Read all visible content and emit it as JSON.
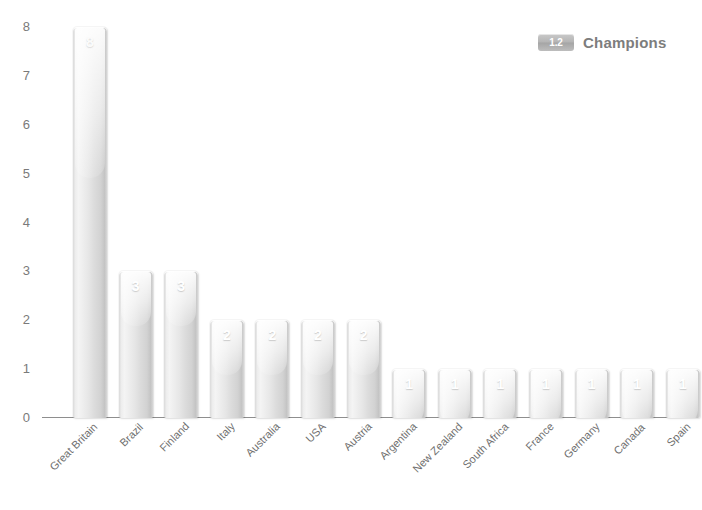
{
  "legend": {
    "swatch_text": "1.2",
    "label": "Champions",
    "swatch_color": "#b4b4b4",
    "label_color": "#7d7d7d"
  },
  "axis": {
    "y_ticks": [
      "0",
      "1",
      "2",
      "3",
      "4",
      "5",
      "6",
      "7",
      "8"
    ],
    "tick_color": "#7a7a7a",
    "baseline_color": "#8e8e8e"
  },
  "chart_data": {
    "type": "bar",
    "title": "Champions",
    "xlabel": "",
    "ylabel": "",
    "ylim": [
      0,
      8
    ],
    "yticks": [
      0,
      1,
      2,
      3,
      4,
      5,
      6,
      7,
      8
    ],
    "grid": false,
    "legend_position": "top-right",
    "orientation": "vertical",
    "bar_color": "#dcdcdc",
    "value_label_color": "#ffffff",
    "categories": [
      "Great Britain",
      "Brazil",
      "Finland",
      "Italy",
      "Australia",
      "USA",
      "Austria",
      "Argentina",
      "New Zealand",
      "South Africa",
      "France",
      "Germany",
      "Canada",
      "Spain"
    ],
    "values": [
      8,
      3,
      3,
      2,
      2,
      2,
      2,
      1,
      1,
      1,
      1,
      1,
      1,
      1
    ],
    "series": [
      {
        "name": "Champions",
        "values": [
          8,
          3,
          3,
          2,
          2,
          2,
          2,
          1,
          1,
          1,
          1,
          1,
          1,
          1
        ]
      }
    ],
    "value_labels": [
      "8",
      "3",
      "3",
      "2",
      "2",
      "2",
      "2",
      "1",
      "1",
      "1",
      "1",
      "1",
      "1",
      "1"
    ]
  }
}
